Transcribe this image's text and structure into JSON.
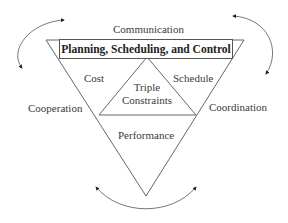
{
  "diagram": {
    "banner": "Planning, Scheduling, and Control",
    "outer_labels": {
      "top": "Communication",
      "left": "Cooperation",
      "right": "Coordination"
    },
    "triangle_labels": {
      "left": "Cost",
      "right": "Schedule",
      "bottom": "Performance"
    },
    "center": {
      "line1": "Triple",
      "line2": "Constraints"
    },
    "colors": {
      "stroke": "#555555",
      "text": "#3a3a3a",
      "arrow": "#222222"
    }
  }
}
